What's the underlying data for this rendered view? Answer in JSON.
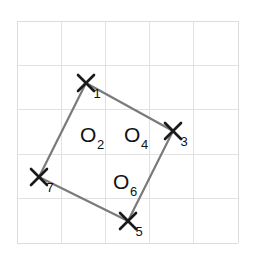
{
  "figure": {
    "background_color": "#ffffff",
    "grid": {
      "line_color": "#e2e2e2",
      "border_color": "#dcdcdc",
      "columns": 5,
      "rows": 5,
      "left": 17,
      "top": 21,
      "right": 238,
      "bottom": 243,
      "cell_width": 44.2,
      "cell_height": 44.4,
      "x_lines": [
        17,
        61.2,
        105.4,
        149.6,
        193.8,
        238
      ],
      "y_lines": [
        21,
        65.4,
        109.8,
        154.2,
        198.6,
        243
      ]
    },
    "shape": {
      "type": "quadrilateral",
      "edge_color": "#7a7a7a",
      "edge_width": 2.2,
      "vertex_color": "#1a1a1a",
      "vertex_stroke_width": 2.6,
      "vertex_arm": 8,
      "vertices": [
        {
          "label": "X",
          "subscript": "1",
          "x": 86,
          "y": 83,
          "sub_x": 97,
          "sub_y": 98,
          "label_x": 78,
          "label_y": 91
        },
        {
          "label": "X",
          "subscript": "3",
          "x": 173,
          "y": 131,
          "sub_x": 184,
          "sub_y": 146,
          "label_x": 165,
          "label_y": 139
        },
        {
          "label": "X",
          "subscript": "5",
          "x": 128,
          "y": 221,
          "sub_x": 139,
          "sub_y": 236,
          "label_x": 120,
          "label_y": 229
        },
        {
          "label": "X",
          "subscript": "7",
          "x": 39,
          "y": 177,
          "sub_x": 50,
          "sub_y": 192,
          "label_x": 31,
          "label_y": 185
        }
      ],
      "edges": [
        {
          "from": 0,
          "to": 1
        },
        {
          "from": 1,
          "to": 2
        },
        {
          "from": 2,
          "to": 3
        },
        {
          "from": 3,
          "to": 0
        }
      ]
    },
    "face_labels": [
      {
        "label": "O",
        "subscript": "2",
        "x": 80,
        "y": 142,
        "sub_x": 97,
        "sub_y": 149
      },
      {
        "label": "O",
        "subscript": "4",
        "x": 124,
        "y": 142,
        "sub_x": 141,
        "sub_y": 149
      },
      {
        "label": "O",
        "subscript": "6",
        "x": 113,
        "y": 189,
        "sub_x": 130,
        "sub_y": 196
      }
    ]
  },
  "chart_data": {
    "type": "scatter",
    "xlabel": "",
    "ylabel": "",
    "grid": true,
    "legend": "none",
    "xlim": [
      0,
      5
    ],
    "ylim": [
      0,
      5
    ],
    "xticks": [
      0,
      1,
      2,
      3,
      4,
      5
    ],
    "yticks": [
      0,
      1,
      2,
      3,
      4,
      5
    ],
    "tick_labels_visible": false,
    "annotations": [
      "X1",
      "X3",
      "X5",
      "X7",
      "O2",
      "O4",
      "O6"
    ],
    "series": [
      {
        "name": "vertices",
        "labels": [
          "X1",
          "X3",
          "X5",
          "X7"
        ],
        "x": [
          1.56,
          3.53,
          2.51,
          0.5
        ],
        "y": [
          3.6,
          2.52,
          0.5,
          1.48
        ]
      },
      {
        "name": "face-labels",
        "labels": [
          "O2",
          "O4",
          "O6"
        ],
        "x": [
          1.55,
          2.55,
          2.3
        ],
        "y": [
          2.27,
          2.27,
          1.21
        ]
      }
    ],
    "polygon": {
      "name": "quadrilateral",
      "closed": true,
      "vertex_order": [
        "X1",
        "X3",
        "X5",
        "X7"
      ],
      "x": [
        1.56,
        3.53,
        2.51,
        0.5
      ],
      "y": [
        3.6,
        2.52,
        0.5,
        1.48
      ]
    }
  }
}
